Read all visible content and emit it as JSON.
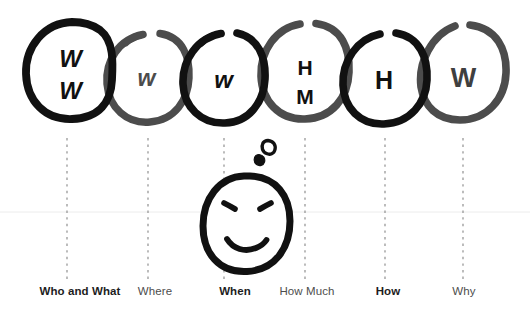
{
  "diagram": {
    "colors": {
      "ink_dark": "#111111",
      "ink_gray": "#4c4c4c",
      "background": "#ffffff",
      "dotted_line": "#8c8c8c",
      "baseline": "#e6e6e6",
      "label_bold": "#1d1d1d",
      "label_light": "#4d4d4d"
    },
    "rings": [
      {
        "id": "ring-1",
        "letters": [
          "W",
          "W"
        ],
        "tone": "dark",
        "cx": 69,
        "cy": 70,
        "rx": 43,
        "ry": 48
      },
      {
        "id": "ring-2",
        "letters": [
          "w"
        ],
        "tone": "gray",
        "cx": 148,
        "cy": 77,
        "rx": 41,
        "ry": 45
      },
      {
        "id": "ring-3",
        "letters": [
          "w"
        ],
        "tone": "dark",
        "cx": 224,
        "cy": 77,
        "rx": 41,
        "ry": 45
      },
      {
        "id": "ring-4",
        "letters": [
          "H",
          "M"
        ],
        "tone": "gray",
        "cx": 305,
        "cy": 70,
        "rx": 43,
        "ry": 48
      },
      {
        "id": "ring-5",
        "letters": [
          "H"
        ],
        "tone": "dark",
        "cx": 385,
        "cy": 77,
        "rx": 41,
        "ry": 45
      },
      {
        "id": "ring-6",
        "letters": [
          "W"
        ],
        "tone": "gray",
        "cx": 463,
        "cy": 72,
        "rx": 43,
        "ry": 47
      }
    ],
    "face": {
      "name": "smiley-face",
      "cx": 246,
      "cy": 224,
      "rx": 44,
      "ry": 48,
      "expression": "smiling",
      "thought_bubbles": [
        {
          "cx": 268,
          "cy": 147,
          "r": 6.5,
          "filled": false
        },
        {
          "cx": 259,
          "cy": 160,
          "r": 5.0,
          "filled": true
        }
      ]
    },
    "guides": {
      "dotted_x": [
        67,
        148,
        224,
        305,
        385,
        463
      ],
      "dotted_top": 138,
      "dotted_bottom": 283,
      "baseline_y": 212
    },
    "labels": [
      {
        "text": "Who and What",
        "x": 80,
        "y": 292,
        "emphasis": "bold"
      },
      {
        "text": "Where",
        "x": 155,
        "y": 292,
        "emphasis": "light"
      },
      {
        "text": "When",
        "x": 235,
        "y": 292,
        "emphasis": "bold"
      },
      {
        "text": "How Much",
        "x": 307,
        "y": 292,
        "emphasis": "light"
      },
      {
        "text": "How",
        "x": 388,
        "y": 292,
        "emphasis": "bold"
      },
      {
        "text": "Why",
        "x": 464,
        "y": 292,
        "emphasis": "light"
      }
    ]
  }
}
